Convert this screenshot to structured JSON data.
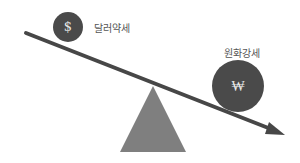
{
  "diagram": {
    "labels": {
      "dollar": "달러약세",
      "won": "원화강세"
    },
    "symbols": {
      "dollar": "$",
      "won": "₩"
    },
    "colors": {
      "coin": "#4a4a4a",
      "beam": "#474747",
      "fulcrum": "#7f7f7f",
      "symbol": "#e8e8e8",
      "label": "#555555",
      "background": "#ffffff"
    }
  }
}
